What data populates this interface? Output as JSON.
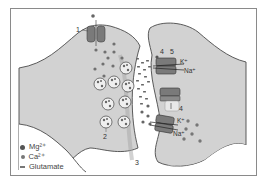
{
  "figure": {
    "labels": {
      "l1": "1",
      "l2": "2",
      "l3": "3",
      "l4a": "4",
      "l4b": "4",
      "l5": "5",
      "k_top": "K⁺",
      "na_top": "Na⁺",
      "k_bottom": "K⁺",
      "na_bottom": "Na⁺"
    },
    "legend": [
      {
        "symbol": "large-dot",
        "label": "Mg²⁺"
      },
      {
        "symbol": "small-dot",
        "label": "Ca²⁺"
      },
      {
        "symbol": "dash",
        "label": "Glutamate"
      }
    ],
    "colors": {
      "cell_fill": "#cfcfcf",
      "cell_stroke": "#555555",
      "channel_fill": "#7a7a7a",
      "frame": "#888888",
      "ion_dark": "#666666"
    }
  }
}
